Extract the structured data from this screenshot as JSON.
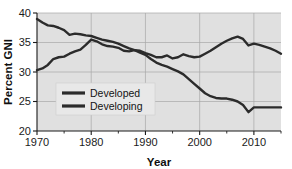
{
  "chart_data": {
    "type": "line",
    "title": "",
    "xlabel": "Year",
    "ylabel": "Percent GNI",
    "xlim": [
      1970,
      2015
    ],
    "ylim": [
      20,
      40
    ],
    "xticks": [
      1970,
      1980,
      1990,
      2000,
      2010
    ],
    "yticks": [
      20,
      25,
      30,
      35,
      40
    ],
    "grid": true,
    "legend_position": "lower-left-inside",
    "plot_background": "#e0e0e0",
    "line_color": "#2b2b2b",
    "grid_color": "#a8a8a8",
    "series": [
      {
        "name": "Developed",
        "x": [
          1970,
          1971,
          1972,
          1973,
          1974,
          1975,
          1976,
          1977,
          1978,
          1979,
          1980,
          1981,
          1982,
          1983,
          1984,
          1985,
          1986,
          1987,
          1988,
          1989,
          1990,
          1991,
          1992,
          1993,
          1994,
          1995,
          1996,
          1997,
          1998,
          1999,
          2000,
          2001,
          2002,
          2003,
          2004,
          2005,
          2006,
          2007,
          2008,
          2009,
          2010,
          2011,
          2012,
          2013,
          2014,
          2015
        ],
        "values": [
          39.0,
          38.4,
          37.9,
          37.8,
          37.5,
          37.1,
          36.3,
          36.5,
          36.4,
          36.2,
          36.1,
          35.8,
          35.5,
          35.3,
          35.1,
          34.8,
          34.4,
          34.0,
          33.7,
          33.3,
          32.9,
          32.2,
          31.6,
          31.2,
          30.9,
          30.5,
          30.1,
          29.6,
          28.8,
          28.0,
          27.2,
          26.4,
          25.9,
          25.6,
          25.5,
          25.5,
          25.3,
          25.0,
          24.4,
          23.2,
          24.0,
          24.0,
          24.0,
          24.0,
          24.0,
          24.0
        ]
      },
      {
        "name": "Developing",
        "x": [
          1970,
          1971,
          1972,
          1973,
          1974,
          1975,
          1976,
          1977,
          1978,
          1979,
          1980,
          1981,
          1982,
          1983,
          1984,
          1985,
          1986,
          1987,
          1988,
          1989,
          1990,
          1991,
          1992,
          1993,
          1994,
          1995,
          1996,
          1997,
          1998,
          1999,
          2000,
          2001,
          2002,
          2003,
          2004,
          2005,
          2006,
          2007,
          2008,
          2009,
          2010,
          2011,
          2012,
          2013,
          2014,
          2015
        ],
        "values": [
          30.3,
          30.6,
          31.2,
          32.2,
          32.5,
          32.6,
          33.1,
          33.5,
          33.8,
          34.6,
          35.5,
          35.2,
          34.7,
          34.4,
          34.3,
          34.1,
          33.6,
          33.5,
          33.7,
          33.6,
          33.2,
          32.9,
          32.5,
          32.5,
          32.8,
          32.3,
          32.5,
          33.0,
          32.7,
          32.5,
          32.6,
          33.1,
          33.6,
          34.2,
          34.8,
          35.3,
          35.7,
          36.0,
          35.6,
          34.5,
          34.8,
          34.6,
          34.3,
          34.0,
          33.6,
          33.1
        ]
      }
    ]
  },
  "legend": {
    "items": [
      {
        "label": "Developed"
      },
      {
        "label": "Developing"
      }
    ]
  },
  "axes": {
    "y_title": "Percent GNI",
    "x_title": "Year",
    "y_tick_labels": [
      "20",
      "25",
      "30",
      "35",
      "40"
    ],
    "x_tick_labels": [
      "1970",
      "1980",
      "1990",
      "2000",
      "2010"
    ]
  }
}
